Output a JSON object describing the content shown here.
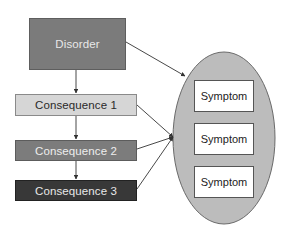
{
  "diagram": {
    "nodes": {
      "disorder": {
        "label": "Disorder",
        "fill": "#7b7b7b"
      },
      "consequences": [
        {
          "label": "Consequence 1",
          "fill": "#d6d6d6"
        },
        {
          "label": "Consequence 2",
          "fill": "#7c7c7c"
        },
        {
          "label": "Consequence 3",
          "fill": "#383838"
        }
      ],
      "symptom_group": {
        "fill": "#bcbcbc",
        "symptoms": [
          {
            "label": "Symptom"
          },
          {
            "label": "Symptom"
          },
          {
            "label": "Symptom"
          }
        ]
      }
    },
    "edges": [
      {
        "from": "Disorder",
        "to": "Consequence 1"
      },
      {
        "from": "Consequence 1",
        "to": "Consequence 2"
      },
      {
        "from": "Consequence 2",
        "to": "Consequence 3"
      },
      {
        "from": "Disorder",
        "to": "Symptom group"
      },
      {
        "from": "Consequence 1",
        "to": "Symptom group"
      },
      {
        "from": "Consequence 2",
        "to": "Symptom group"
      },
      {
        "from": "Consequence 3",
        "to": "Symptom group"
      }
    ]
  }
}
